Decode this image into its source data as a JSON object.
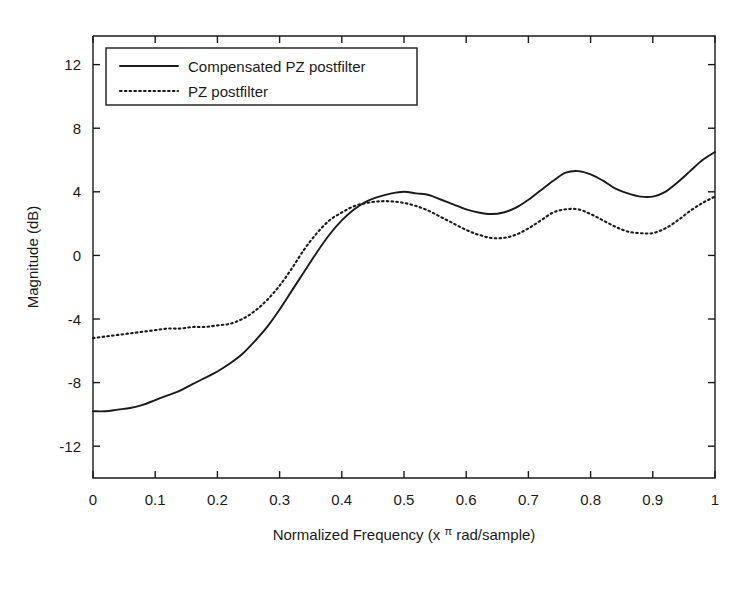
{
  "chart_data": {
    "type": "line",
    "title": "",
    "xlabel": "Normalized Frequency (x π rad/sample)",
    "xlabel_prefix": "Normalized Frequency (x ",
    "xlabel_pi": "π",
    "xlabel_suffix": " rad/sample)",
    "ylabel": "Magnitude (dB)",
    "xlim": [
      0,
      1
    ],
    "ylim": [
      -14,
      13.8
    ],
    "xticks": [
      0,
      0.1,
      0.2,
      0.3,
      0.4,
      0.5,
      0.6,
      0.7,
      0.8,
      0.9,
      1
    ],
    "xtick_labels": [
      "0",
      "0.1",
      "0.2",
      "0.3",
      "0.4",
      "0.5",
      "0.6",
      "0.7",
      "0.8",
      "0.9",
      "1"
    ],
    "yticks": [
      -12,
      -8,
      -4,
      0,
      4,
      8,
      12
    ],
    "ytick_labels": [
      "-12",
      "-8",
      "-4",
      "0",
      "4",
      "8",
      "12"
    ],
    "grid": false,
    "legend_position": "upper-left",
    "legend_entries": [
      {
        "label": "Compensated PZ postfilter",
        "style": "solid"
      },
      {
        "label": "PZ postfilter",
        "style": "dotted"
      }
    ],
    "series": [
      {
        "name": "Compensated PZ postfilter",
        "style": "solid",
        "color": "#1a1a1a",
        "x": [
          0.0,
          0.02,
          0.04,
          0.06,
          0.08,
          0.1,
          0.12,
          0.14,
          0.16,
          0.18,
          0.2,
          0.22,
          0.24,
          0.26,
          0.28,
          0.3,
          0.32,
          0.34,
          0.36,
          0.38,
          0.4,
          0.42,
          0.44,
          0.46,
          0.48,
          0.5,
          0.52,
          0.54,
          0.56,
          0.58,
          0.6,
          0.62,
          0.64,
          0.66,
          0.68,
          0.7,
          0.72,
          0.74,
          0.76,
          0.78,
          0.8,
          0.82,
          0.84,
          0.86,
          0.88,
          0.9,
          0.92,
          0.94,
          0.96,
          0.98,
          1.0
        ],
        "values": [
          -9.8,
          -9.8,
          -9.7,
          -9.6,
          -9.4,
          -9.1,
          -8.8,
          -8.5,
          -8.1,
          -7.7,
          -7.3,
          -6.8,
          -6.2,
          -5.4,
          -4.5,
          -3.4,
          -2.2,
          -1.0,
          0.2,
          1.3,
          2.2,
          2.9,
          3.4,
          3.7,
          3.9,
          4.0,
          3.9,
          3.8,
          3.5,
          3.2,
          2.9,
          2.7,
          2.6,
          2.7,
          3.0,
          3.5,
          4.1,
          4.7,
          5.2,
          5.3,
          5.1,
          4.7,
          4.2,
          3.9,
          3.7,
          3.7,
          4.0,
          4.6,
          5.3,
          6.0,
          6.5
        ]
      },
      {
        "name": "PZ postfilter",
        "style": "dotted",
        "color": "#1a1a1a",
        "x": [
          0.0,
          0.02,
          0.04,
          0.06,
          0.08,
          0.1,
          0.12,
          0.14,
          0.16,
          0.18,
          0.2,
          0.22,
          0.24,
          0.26,
          0.28,
          0.3,
          0.32,
          0.34,
          0.36,
          0.38,
          0.4,
          0.42,
          0.44,
          0.46,
          0.48,
          0.5,
          0.52,
          0.54,
          0.56,
          0.58,
          0.6,
          0.62,
          0.64,
          0.66,
          0.68,
          0.7,
          0.72,
          0.74,
          0.76,
          0.78,
          0.8,
          0.82,
          0.84,
          0.86,
          0.88,
          0.9,
          0.92,
          0.94,
          0.96,
          0.98,
          1.0
        ],
        "values": [
          -5.2,
          -5.1,
          -5.0,
          -4.9,
          -4.8,
          -4.7,
          -4.6,
          -4.6,
          -4.5,
          -4.5,
          -4.4,
          -4.3,
          -4.0,
          -3.5,
          -2.8,
          -1.9,
          -0.8,
          0.4,
          1.4,
          2.2,
          2.7,
          3.1,
          3.3,
          3.4,
          3.4,
          3.3,
          3.1,
          2.8,
          2.4,
          2.0,
          1.6,
          1.3,
          1.1,
          1.1,
          1.3,
          1.7,
          2.2,
          2.7,
          2.9,
          2.9,
          2.6,
          2.2,
          1.8,
          1.5,
          1.4,
          1.4,
          1.7,
          2.2,
          2.8,
          3.3,
          3.7
        ]
      }
    ]
  }
}
